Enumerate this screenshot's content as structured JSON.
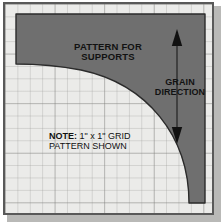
{
  "figure": {
    "kind": "woodworking-grid-pattern-template",
    "title_text": "PATTERN FOR\nSUPPORTS",
    "grain_text": "GRAIN\nDIRECTION",
    "note_label": "NOTE:",
    "note_text": " 1\" x 1\" GRID\nPATTERN SHOWN",
    "grid": {
      "minor_cell_label": "1\"",
      "columns": 16,
      "rows": 16,
      "major_every": 4
    },
    "icons": {
      "arrow_up": "arrow-up-icon",
      "arrow_down": "arrow-down-icon",
      "grain_axis": "grain-axis-line-icon"
    },
    "colors": {
      "page_background": "#ffffff",
      "plate_background": "#ebebe9",
      "plate_border": "#595959",
      "plate_shadow": "#b9b9b7",
      "grid_minor_line": "#969694",
      "grid_major_line": "#787876",
      "pattern_fill": "#6f6f6f",
      "pattern_stroke": "#2b2b2b",
      "text": "#121212"
    }
  }
}
